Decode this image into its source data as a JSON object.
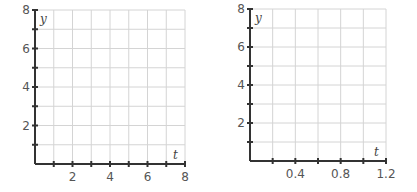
{
  "chart_data": [
    {
      "type": "scatter",
      "title": "",
      "xlabel": "t",
      "ylabel": "y",
      "xlim": [
        0,
        8
      ],
      "ylim": [
        0,
        8
      ],
      "x_major_step": 1,
      "y_major_step": 1,
      "xticks": [
        "2",
        "4",
        "6",
        "8"
      ],
      "yticks": [
        "2",
        "4",
        "6",
        "8"
      ],
      "grid": true,
      "series": []
    },
    {
      "type": "scatter",
      "title": "",
      "xlabel": "t",
      "ylabel": "y",
      "xlim": [
        0,
        1.2
      ],
      "ylim": [
        0,
        8
      ],
      "x_major_step": 0.2,
      "y_major_step": 1,
      "xticks": [
        "0.4",
        "0.8",
        "1.2"
      ],
      "yticks": [
        "2",
        "4",
        "6",
        "8"
      ],
      "grid": true,
      "series": []
    }
  ]
}
